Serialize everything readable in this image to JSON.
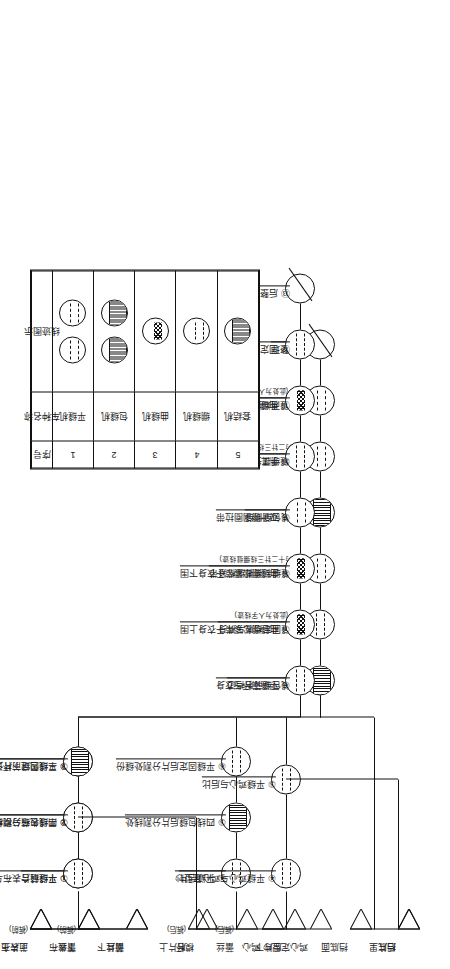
{
  "diagram": {
    "orientation": "rotated-90ccw"
  },
  "flow_top": {
    "name": "前后片/裆底 缝制流程",
    "materials": [
      {
        "label": "前片上",
        "sub": "(裤前)"
      },
      {
        "label": "蕾丝",
        "sub": "(裤前)"
      },
      {
        "label": "前片下",
        "sub": ""
      },
      {
        "label": "后片上",
        "sub": "(裤后)"
      },
      {
        "label": "蕾丝",
        "sub": "(裤后)"
      },
      {
        "label": "后片下",
        "sub": ""
      },
      {
        "label": "挡底面",
        "sub": ""
      },
      {
        "label": "挡底里",
        "sub": ""
      }
    ],
    "branch_front": [
      {
        "no": "①",
        "label": "平缝前片",
        "sub": "",
        "machine": "flat"
      },
      {
        "no": "②",
        "label": "四线包缝分割线处",
        "sub": "",
        "machine": "overlock"
      },
      {
        "no": "③",
        "label": "平缝固定前片分割处缝份",
        "sub": "",
        "machine": "flat"
      }
    ],
    "branch_back": [
      {
        "no": "④",
        "label": "平缝后片",
        "sub": "",
        "machine": "flat"
      },
      {
        "no": "⑤",
        "label": "四线包缝后片分割线处",
        "sub": "",
        "machine": "overlock"
      },
      {
        "no": "⑥",
        "label": "平缝固定后片分割处缝份",
        "sub": "",
        "machine": "flat"
      }
    ],
    "main_chain": [
      {
        "no": "⑦",
        "label": "四线包缝前后裆边",
        "sub": "",
        "machine": "overlock"
      },
      {
        "no": "⑧",
        "label": "平缝固定裆底与裤身",
        "sub": "",
        "machine": "flat"
      },
      {
        "no": "⑨",
        "label": "绷缝缝制腰脚绷松紧带",
        "sub": "(此处为十二针三线绷缝线迹)",
        "machine": "cover"
      },
      {
        "no": "⑩",
        "label": "四线包缝侧缝",
        "sub": "",
        "machine": "overlock"
      },
      {
        "no": "⑪",
        "label": "绷缝绷腰头松紧带",
        "sub": "(此处为二针三线绷缝线迹)",
        "machine": "cover"
      },
      {
        "no": "⑫",
        "label": "绷缝两端打枣固定",
        "sub": "",
        "machine": "cover"
      },
      {
        "no": "⑬",
        "label": "后整理",
        "sub": "",
        "machine": "finish"
      }
    ]
  },
  "flow_bottom": {
    "name": "表布/模杯/鸡心 缝制流程",
    "materials": [
      {
        "label": "上表布",
        "sub": ""
      },
      {
        "label": "下表布",
        "sub": ""
      },
      {
        "label": "蕾丝",
        "sub": ""
      },
      {
        "label": "模杯",
        "sub": ""
      },
      {
        "label": "鸡心",
        "sub": ""
      },
      {
        "label": "鸡心定型纱",
        "sub": ""
      },
      {
        "label": "后片",
        "sub": ""
      }
    ],
    "branch_fabric": [
      {
        "no": "①",
        "label": "平缝缝合表布与蕾丝",
        "sub": "",
        "machine": "flat"
      },
      {
        "no": "②",
        "label": "平缝表布与模杯",
        "sub": "",
        "machine": "flat"
      },
      {
        "no": "③",
        "label": "三线包缝下杯边",
        "sub": "",
        "machine": "overlock"
      }
    ],
    "branch_core": [
      {
        "no": "④",
        "label": "平缝鸡心与鸡心定型纱",
        "sub": "",
        "machine": "flat"
      },
      {
        "no": "⑤",
        "label": "平缝鸡心与后比",
        "sub": "",
        "machine": "flat"
      }
    ],
    "main_chain": [
      {
        "no": "⑥",
        "label": "平缝罩杯与衣身",
        "sub": "",
        "machine": "flat"
      },
      {
        "no": "⑦",
        "label": "曲缝绷松紧带于衣身上围",
        "sub": "(此处为人字线迹)",
        "machine": "zig"
      },
      {
        "no": "⑧",
        "label": "曲缝绷松紧带于衣身下围",
        "sub": "",
        "machine": "zig"
      },
      {
        "no": "⑨",
        "label": "双针绷钢圈拉带",
        "sub": "",
        "machine": "cover"
      },
      {
        "no": "⑩",
        "label": "手工穿入钢圈",
        "sub": "",
        "machine": "flat"
      },
      {
        "no": "⑪",
        "label": "曲缝缝钩圈、钩扣",
        "sub": "(此处为人字线迹)",
        "machine": "zig"
      },
      {
        "no": "⑫",
        "label": "固定肩带、封钢圈两端",
        "sub": "",
        "machine": "flat"
      },
      {
        "no": "⑬",
        "label": "后整理",
        "sub": "",
        "machine": "finish"
      }
    ]
  },
  "legend": {
    "headers": [
      "序号",
      "车种名称",
      "线迹图示"
    ],
    "rows": [
      {
        "no": "1",
        "name": "平缝机",
        "glyph": "flat",
        "count": 2
      },
      {
        "no": "2",
        "name": "包缝机",
        "glyph": "overlock",
        "count": 2
      },
      {
        "no": "3",
        "name": "曲缝机",
        "glyph": "zig",
        "count": 1
      },
      {
        "no": "4",
        "name": "绷缝机",
        "glyph": "cover",
        "count": 1
      },
      {
        "no": "5",
        "name": "套结机",
        "glyph": "bartack",
        "count": 1
      }
    ]
  }
}
